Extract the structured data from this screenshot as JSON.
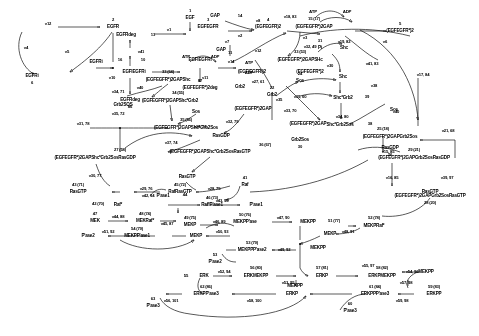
{
  "diagram": {
    "ink_color": "#111111",
    "background": "#fdfdfd"
  },
  "species": [
    {
      "id": "s-egf",
      "label": "EGF",
      "num": "1",
      "x": 190,
      "y": 18
    },
    {
      "id": "s-egfr",
      "label": "EGFR",
      "num": "2",
      "x": 113,
      "y": 27
    },
    {
      "id": "s-egfegfr",
      "label": "EGFEGFR",
      "num": "3",
      "x": 208,
      "y": 27
    },
    {
      "id": "s-egfegfr2",
      "label": "(EGFEGFR)2",
      "num": "4",
      "x": 266,
      "y": 27
    },
    {
      "id": "s-egfegfrp2",
      "label": "(EGFEGFR*)2",
      "num": "5",
      "x": 349,
      "y": 32
    },
    {
      "id": "s-egfri",
      "label": "EGFRi",
      "num": "6",
      "x": 40,
      "y": 76
    },
    {
      "id": "s-egfrdeg-top",
      "label": "EGFRdeg",
      "num": "13",
      "x": 130,
      "y": 35
    },
    {
      "id": "s-egfri2",
      "label": "EGFRi",
      "num": "16",
      "x": 96,
      "y": 62
    },
    {
      "id": "s-egfiegfri",
      "label": "EGFIEGFRi",
      "num": "10",
      "x": 130,
      "y": 72
    },
    {
      "id": "s-egfiegfri2",
      "label": "EGFIEGFRi",
      "num": "11",
      "x": 200,
      "y": 62
    },
    {
      "id": "s-egfiegfri2p",
      "label": "(EGFIEGFRi)2",
      "num": "",
      "x": 247,
      "y": 72
    },
    {
      "id": "s-egfegfrp2b",
      "label": "(EGFEGFR*)2",
      "num": "",
      "x": 300,
      "y": 72
    },
    {
      "id": "s-egfrdeg-bot",
      "label": "EGFRdeg",
      "num": "86",
      "x": 130,
      "y": 100
    },
    {
      "id": "s-egfegfrp2deg",
      "label": "(EGFEGFR*)2deg",
      "num": "87",
      "x": 200,
      "y": 88
    },
    {
      "id": "s-gap",
      "label": "GAP",
      "num": "14",
      "x": 232,
      "y": 16
    },
    {
      "id": "s-gap2",
      "label": "GAP",
      "num": "",
      "x": 221,
      "y": 50
    },
    {
      "id": "s-egfegfrp2gap",
      "label": "(EGFEGFR*)2GAP",
      "num": "15 (17)",
      "x": 300,
      "y": 27
    },
    {
      "id": "s-egfegfrp2gapsh",
      "label": "(EGFEGFR*)2GAPSHc",
      "num": "33 (53)",
      "x": 283,
      "y": 60
    },
    {
      "id": "s-pi",
      "label": "Pi",
      "num": "31",
      "x": 320,
      "y": 48
    },
    {
      "id": "s-shc-r",
      "label": "Shc",
      "num": "",
      "x": 338,
      "y": 48
    },
    {
      "id": "s-egfegfrp2gapshc2",
      "label": "(EGFEGFR*)2GAPShc",
      "num": "33 (64)",
      "x": 168,
      "y": 80
    },
    {
      "id": "s-grb2-c",
      "label": "Grb2",
      "num": "",
      "x": 238,
      "y": 87
    },
    {
      "id": "s-shc-c",
      "label": "Shc",
      "num": "",
      "x": 340,
      "y": 77
    },
    {
      "id": "s-shcgrb2",
      "label": "Shc*Grb2",
      "num": "39",
      "x": 341,
      "y": 98
    },
    {
      "id": "s-egfegfrp2gapshcgrb2",
      "label": "(EGFEGFR*)2GAPShc*Grb2",
      "num": "34 (55)",
      "x": 170,
      "y": 101
    },
    {
      "id": "s-sos-c",
      "label": "Sos",
      "num": "",
      "x": 196,
      "y": 110
    },
    {
      "id": "s-egfegfrp2gap-c",
      "label": "(EGFEGFR*)2GAP",
      "num": "",
      "x": 242,
      "y": 109
    },
    {
      "id": "s-shcgrb2sos",
      "label": "Shc*Grb2Sos",
      "num": "38",
      "x": 334,
      "y": 125
    },
    {
      "id": "s-sos-r",
      "label": "Sos",
      "num": "",
      "x": 392,
      "y": 110
    },
    {
      "id": "s-grb2sos",
      "label": "Grb2SOS",
      "num": "",
      "x": 123,
      "y": 105
    },
    {
      "id": "s-egfegfrp2gapshcgrb2sos",
      "label": "(EGFEGFR*)2GAPShc*Grb2Sos",
      "num": "35 (56)",
      "x": 176,
      "y": 127
    },
    {
      "id": "s-grb2sos-r",
      "label": "Grb2Sos",
      "num": "30",
      "x": 298,
      "y": 140
    },
    {
      "id": "s-egfegfrp2gapgrb2sos",
      "label": "(EGFEGFR*)2GAPGrb2Sos",
      "num": "25 (18)",
      "x": 383,
      "y": 131
    },
    {
      "id": "s-egfegfrp2gap-b",
      "label": "(EGFEGFR*)2GAP",
      "num": "",
      "x": 308,
      "y": 124
    },
    {
      "id": "s-rasgdp",
      "label": "RasGDP",
      "num": "",
      "x": 221,
      "y": 136
    },
    {
      "id": "s-rasgdp-r",
      "label": "RasGDP",
      "num": "26",
      "x": 390,
      "y": 148
    },
    {
      "id": "s-egfegfrp2gapshcgrb2sosrasgdp",
      "label": "(EGFEGFR*)2GAPShc*Grb2SosRasGDP",
      "num": "27 (58)",
      "x": 95,
      "y": 158
    },
    {
      "id": "s-egfegfrp2gapgrb2sosrasgdp",
      "label": "(EGFEGFR*)2GAPGrb2SosRasGDP",
      "num": "29 (21)",
      "x": 414,
      "y": 158
    },
    {
      "id": "s-egfegfrp2gapgrb2sosrasgtp",
      "label": "(EGFEGFR*)2GAPGrb2SosRasGTP",
      "num": "28 (20)",
      "x": 414,
      "y": 192
    },
    {
      "id": "s-egfegfrp2gapshcgrb2sosrasgtp",
      "label": "(EGFEGFR*)2GAPShc*Grb2SosRasGTP",
      "num": "36 (67)",
      "x": 210,
      "y": 152
    },
    {
      "id": "s-rasgtp-mid",
      "label": "RasGTP",
      "num": "",
      "x": 187,
      "y": 177
    },
    {
      "id": "s-rasgtp-r",
      "label": "RasGTP",
      "num": "",
      "x": 420,
      "y": 192
    },
    {
      "id": "s-rasgtp-l",
      "label": "RasGTP",
      "num": "43 (71)",
      "x": 78,
      "y": 189
    },
    {
      "id": "s-rafrasgtp",
      "label": "RafRasGTP",
      "num": "45 (72)",
      "x": 176,
      "y": 189
    },
    {
      "id": "s-raf",
      "label": "Raf",
      "num": "41",
      "x": 243,
      "y": 181
    },
    {
      "id": "s-rafp",
      "label": "Raf*",
      "num": "46 (73)",
      "x": 144,
      "y": 200
    },
    {
      "id": "s-rafstar",
      "label": "Raf*",
      "num": "42 (70)",
      "x": 105,
      "y": 202
    },
    {
      "id": "s-pase1",
      "label": "P'ase1",
      "num": "44",
      "x": 160,
      "y": 196
    },
    {
      "id": "s-rafppase1",
      "label": "Raf*P'ase1",
      "num": "46 (73)",
      "x": 181,
      "y": 201
    },
    {
      "id": "s-pase1-r",
      "label": "P'ase1",
      "num": "",
      "x": 248,
      "y": 201
    },
    {
      "id": "s-mek",
      "label": "MEK",
      "num": "47",
      "x": 93,
      "y": 217
    },
    {
      "id": "s-mekraf",
      "label": "MEKRaf*",
      "num": "48 (74)",
      "x": 143,
      "y": 217
    },
    {
      "id": "s-mekp",
      "label": "MEKP",
      "num": "49 (75)",
      "x": 185,
      "y": 221
    },
    {
      "id": "s-mekppase",
      "label": "MEKPP'ase",
      "num": "50 (76)",
      "x": 245,
      "y": 219
    },
    {
      "id": "s-mekpp-a",
      "label": "MEKPP",
      "num": "51 (77)",
      "x": 306,
      "y": 219
    },
    {
      "id": "s-mekpraf",
      "label": "MEKPRaf*",
      "num": "52 (78)",
      "x": 370,
      "y": 222
    },
    {
      "id": "s-mekppase1",
      "label": "MEKPP'ase1",
      "num": "54 (79)",
      "x": 133,
      "y": 232
    },
    {
      "id": "s-pase2",
      "label": "P'ase2",
      "num": "",
      "x": 84,
      "y": 232
    },
    {
      "id": "s-mekp2",
      "label": "MEKP",
      "num": "",
      "x": 194,
      "y": 232
    },
    {
      "id": "s-mekp3",
      "label": "MEKP",
      "num": "",
      "x": 327,
      "y": 232
    },
    {
      "id": "s-mekppase2",
      "label": "MEKPPP'ase2",
      "num": "53 (79)",
      "x": 249,
      "y": 246
    },
    {
      "id": "s-mekpp-b",
      "label": "MEKPP",
      "num": "",
      "x": 318,
      "y": 246
    },
    {
      "id": "s-pase2-b",
      "label": "P'ase2",
      "num": "53",
      "x": 215,
      "y": 258
    },
    {
      "id": "s-erk",
      "label": "ERK",
      "num": "55",
      "x": 200,
      "y": 272
    },
    {
      "id": "s-erkmekpp",
      "label": "ERKMEKPP",
      "num": "56 (80)",
      "x": 258,
      "y": 272
    },
    {
      "id": "s-erkp",
      "label": "ERKP",
      "num": "57 (81)",
      "x": 320,
      "y": 272
    },
    {
      "id": "s-erkpmekpp",
      "label": "ERKPMEKPP",
      "num": "58 (82)",
      "x": 382,
      "y": 272
    },
    {
      "id": "s-mekpp-c",
      "label": "MEKPP",
      "num": "",
      "x": 295,
      "y": 283
    },
    {
      "id": "s-erkppase3",
      "label": "ERKPP'ase3",
      "num": "62 (86)",
      "x": 206,
      "y": 290
    },
    {
      "id": "s-erkp2",
      "label": "ERKP",
      "num": "",
      "x": 289,
      "y": 290
    },
    {
      "id": "s-erkppase3b",
      "label": "ERKPPP'ase3",
      "num": "61 (84)",
      "x": 375,
      "y": 290
    },
    {
      "id": "s-erkpp",
      "label": "ERKPP",
      "num": "59 (83)",
      "x": 432,
      "y": 290
    },
    {
      "id": "s-mekpp-d",
      "label": "MEKPP",
      "num": "",
      "x": 420,
      "y": 268
    },
    {
      "id": "s-pase3",
      "label": "P'ase3",
      "num": "63",
      "x": 151,
      "y": 303
    },
    {
      "id": "s-pase3b",
      "label": "P'ase3",
      "num": "60",
      "x": 350,
      "y": 308
    },
    {
      "id": "s-atp1",
      "label": "ATP",
      "num": "",
      "x": 313,
      "y": 12
    },
    {
      "id": "s-adp1",
      "label": "ADP",
      "num": "",
      "x": 342,
      "y": 12
    },
    {
      "id": "s-atp2",
      "label": "ATP",
      "num": "",
      "x": 186,
      "y": 58
    },
    {
      "id": "s-adp2",
      "label": "ADP",
      "num": "",
      "x": 212,
      "y": 58
    },
    {
      "id": "s-atp3",
      "label": "ATP",
      "num": "",
      "x": 247,
      "y": 62
    },
    {
      "id": "s-adp3",
      "label": "ADP",
      "num": "",
      "x": 247,
      "y": 72
    },
    {
      "id": "s-sos-mid",
      "label": "Sos",
      "num": "24",
      "x": 297,
      "y": 78
    },
    {
      "id": "s-grb2-mid",
      "label": "Grb2",
      "num": "22",
      "x": 272,
      "y": 94
    }
  ],
  "fluxes": [
    {
      "id": "v12",
      "label": "v12",
      "x": 48,
      "y": 24
    },
    {
      "id": "v1",
      "label": "v1",
      "x": 169,
      "y": 30
    },
    {
      "id": "v2",
      "label": "v2",
      "x": 238,
      "y": 33
    },
    {
      "id": "v3",
      "label": "v3",
      "x": 305,
      "y": 38
    },
    {
      "id": "v4",
      "label": "v4",
      "x": 26,
      "y": 48
    },
    {
      "id": "v5",
      "label": "v5",
      "x": 67,
      "y": 52
    },
    {
      "id": "v6",
      "label": "v6",
      "x": 382,
      "y": 40
    },
    {
      "id": "v41",
      "label": "v41",
      "x": 138,
      "y": 52
    },
    {
      "id": "v11",
      "label": "v11",
      "x": 205,
      "y": 76
    },
    {
      "id": "v10",
      "label": "v10",
      "x": 112,
      "y": 78
    },
    {
      "id": "v40",
      "label": "v40",
      "x": 140,
      "y": 88
    },
    {
      "id": "v12b",
      "label": "v12",
      "x": 258,
      "y": 50
    },
    {
      "id": "v7",
      "label": "v7",
      "x": 227,
      "y": 42
    },
    {
      "id": "v14",
      "label": "v14",
      "x": 231,
      "y": 60
    },
    {
      "id": "v8",
      "label": "v8",
      "x": 258,
      "y": 19
    },
    {
      "id": "v32",
      "label": "v32, 49",
      "x": 303,
      "y": 40
    },
    {
      "id": "v30",
      "label": "v30",
      "x": 334,
      "y": 63
    },
    {
      "id": "v27",
      "label": "v27, 61",
      "x": 252,
      "y": 77
    },
    {
      "id": "v38",
      "label": "v38",
      "x": 373,
      "y": 85
    },
    {
      "id": "v39",
      "label": "v39, 60",
      "x": 297,
      "y": 95
    },
    {
      "id": "v34",
      "label": "v34, 71",
      "x": 118,
      "y": 92
    },
    {
      "id": "v35",
      "label": "v35, 72",
      "x": 118,
      "y": 113
    },
    {
      "id": "v41b",
      "label": "v41, 83",
      "x": 369,
      "y": 64
    },
    {
      "id": "v40b",
      "label": "v40",
      "x": 394,
      "y": 110
    },
    {
      "id": "v36",
      "label": "v36, 73",
      "x": 199,
      "y": 125
    },
    {
      "id": "v32b",
      "label": "v32, 79",
      "x": 228,
      "y": 120
    },
    {
      "id": "v31",
      "label": "v31, 78",
      "x": 83,
      "y": 124
    },
    {
      "id": "v33",
      "label": "v33, 70",
      "x": 289,
      "y": 110
    },
    {
      "id": "v34b",
      "label": "v34, 80",
      "x": 340,
      "y": 117
    },
    {
      "id": "v35b",
      "label": "v35",
      "x": 277,
      "y": 98
    },
    {
      "id": "v15",
      "label": "v15, 85",
      "x": 384,
      "y": 150
    },
    {
      "id": "v16",
      "label": "v16, 85",
      "x": 389,
      "y": 176
    },
    {
      "id": "v21",
      "label": "v21, 68",
      "x": 447,
      "y": 130
    },
    {
      "id": "v17",
      "label": "v17, 84",
      "x": 420,
      "y": 75
    },
    {
      "id": "v18",
      "label": "v18, 83",
      "x": 290,
      "y": 17
    },
    {
      "id": "v19",
      "label": "v19, 82",
      "x": 340,
      "y": 40
    },
    {
      "id": "v37",
      "label": "v37, 74",
      "x": 171,
      "y": 142
    },
    {
      "id": "v30b",
      "label": "v30, 77",
      "x": 95,
      "y": 176
    },
    {
      "id": "v29",
      "label": "v29, 76",
      "x": 122,
      "y": 188
    },
    {
      "id": "v28",
      "label": "v28, 75",
      "x": 214,
      "y": 187
    },
    {
      "id": "v39b",
      "label": "v39, 97",
      "x": 444,
      "y": 176
    },
    {
      "id": "v42",
      "label": "v42, 94",
      "x": 148,
      "y": 195
    },
    {
      "id": "v43",
      "label": "v43, 95",
      "x": 235,
      "y": 196
    },
    {
      "id": "v44",
      "label": "v44, 88",
      "x": 118,
      "y": 216
    },
    {
      "id": "v45",
      "label": "v45, 87",
      "x": 163,
      "y": 220
    },
    {
      "id": "v46",
      "label": "v46, 89",
      "x": 219,
      "y": 221
    },
    {
      "id": "v47",
      "label": "v47, 90",
      "x": 283,
      "y": 222
    },
    {
      "id": "v48",
      "label": "v48, 91",
      "x": 345,
      "y": 232
    },
    {
      "id": "v51",
      "label": "v51, 92",
      "x": 108,
      "y": 231
    },
    {
      "id": "v50",
      "label": "v50, 93",
      "x": 226,
      "y": 232
    },
    {
      "id": "v49",
      "label": "v49, 92",
      "x": 281,
      "y": 246
    },
    {
      "id": "v52",
      "label": "v52, 94",
      "x": 225,
      "y": 271
    },
    {
      "id": "v53",
      "label": "v53, 95",
      "x": 288,
      "y": 282
    },
    {
      "id": "v54",
      "label": "v54, 96",
      "x": 412,
      "y": 272
    },
    {
      "id": "v55",
      "label": "v55, 97",
      "x": 367,
      "y": 266
    },
    {
      "id": "v56",
      "label": "v56, 101",
      "x": 171,
      "y": 301
    },
    {
      "id": "v57",
      "label": "v57, 98",
      "x": 404,
      "y": 281
    },
    {
      "id": "v58",
      "label": "v58, 100",
      "x": 253,
      "y": 301
    },
    {
      "id": "v59",
      "label": "v59, 98",
      "x": 400,
      "y": 301
    }
  ]
}
